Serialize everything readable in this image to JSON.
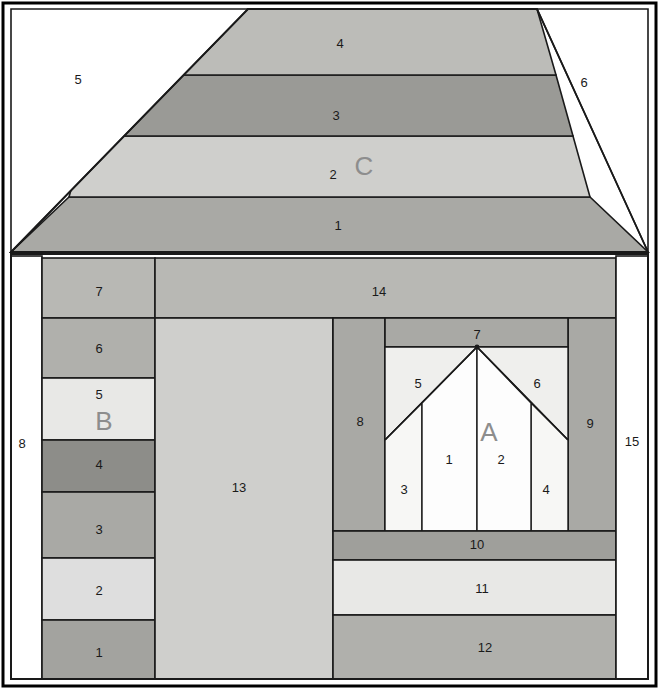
{
  "diagram": {
    "canvas": {
      "width": 659,
      "height": 689,
      "background": "#ffffff"
    },
    "border": {
      "color": "#000000",
      "width": 2
    },
    "palette": {
      "white": "#ffffff",
      "very_light": "#f2f2f0",
      "light": "#e3e3e1",
      "light_mid": "#cfcfcc",
      "mid": "#b8b8b4",
      "mid_dark": "#a9a9a5",
      "dark": "#9a9a96",
      "darker": "#8d8d89",
      "outline": "#1a1a1a",
      "label_text": "#1a1a1a",
      "section_letter": "#8d8d8d"
    },
    "sections": [
      {
        "letter": "C",
        "name": "roof-unit"
      },
      {
        "letter": "B",
        "name": "left-column-unit"
      },
      {
        "letter": "A",
        "name": "window-unit"
      }
    ]
  },
  "roof": {
    "unit_letter": "C",
    "letter_pos": {
      "x": 364,
      "y": 166
    },
    "left_triangle_label": "5",
    "left_triangle_pos": {
      "x": 78,
      "y": 79
    },
    "right_triangle_label": "6",
    "right_triangle_pos": {
      "x": 584,
      "y": 82
    },
    "bands": [
      {
        "label": "1",
        "pos": {
          "x": 338,
          "y": 225
        },
        "fill": "#a9a9a5"
      },
      {
        "label": "2",
        "pos": {
          "x": 333,
          "y": 174
        },
        "fill": "#cfcfcc"
      },
      {
        "label": "3",
        "pos": {
          "x": 336,
          "y": 115
        },
        "fill": "#9a9a96"
      },
      {
        "label": "4",
        "pos": {
          "x": 340,
          "y": 43
        },
        "fill": "#bcbcb8"
      }
    ],
    "geometry": {
      "apex_left_x": 246,
      "apex_right_x": 426,
      "top_y": 9,
      "base_left_x": 11,
      "base_right_x": 648,
      "base_y": 252,
      "band_y": [
        9,
        75,
        136,
        197,
        252
      ]
    }
  },
  "left_column": {
    "unit_letter": "B",
    "letter_pos": {
      "x": 104,
      "y": 421
    },
    "outer_strip": {
      "label": "8",
      "pos": {
        "x": 22,
        "y": 443
      },
      "fill": "#ffffff"
    },
    "pieces": [
      {
        "label": "7",
        "pos": {
          "x": 99,
          "y": 291
        },
        "fill": "#b8b8b4",
        "y0": 258,
        "y1": 318
      },
      {
        "label": "6",
        "pos": {
          "x": 99,
          "y": 348
        },
        "fill": "#b0b0ac",
        "y0": 318,
        "y1": 378
      },
      {
        "label": "5",
        "pos": {
          "x": 99,
          "y": 394
        },
        "fill": "#e8e8e6",
        "y0": 378,
        "y1": 440
      },
      {
        "label": "4",
        "pos": {
          "x": 99,
          "y": 464
        },
        "fill": "#8d8d89",
        "y0": 440,
        "y1": 492
      },
      {
        "label": "3",
        "pos": {
          "x": 99,
          "y": 529
        },
        "fill": "#a9a9a5",
        "y0": 492,
        "y1": 558
      },
      {
        "label": "2",
        "pos": {
          "x": 99,
          "y": 590
        },
        "fill": "#dedede",
        "y0": 558,
        "y1": 620
      },
      {
        "label": "1",
        "pos": {
          "x": 99,
          "y": 652
        },
        "fill": "#a3a39f",
        "y0": 620,
        "y1": 679
      }
    ],
    "x0": 42,
    "x1": 155
  },
  "center": {
    "header": {
      "label": "14",
      "pos": {
        "x": 379,
        "y": 291
      },
      "fill": "#b8b8b4"
    },
    "door": {
      "label": "13",
      "pos": {
        "x": 239,
        "y": 487
      },
      "fill": "#cfcfcc"
    }
  },
  "window_unit": {
    "unit_letter": "A",
    "letter_pos": {
      "x": 489,
      "y": 432
    },
    "frame_left": {
      "label": "8",
      "pos": {
        "x": 360,
        "y": 421
      },
      "fill": "#a9a9a5"
    },
    "frame_right": {
      "label": "9",
      "pos": {
        "x": 590,
        "y": 423
      },
      "fill": "#a9a9a5"
    },
    "header_top": {
      "label": "7",
      "pos": {
        "x": 477,
        "y": 334
      },
      "fill": "#a9a9a5"
    },
    "panes": [
      {
        "label": "5",
        "pos": {
          "x": 418,
          "y": 383
        },
        "fill": "#efefed"
      },
      {
        "label": "6",
        "pos": {
          "x": 537,
          "y": 383
        },
        "fill": "#efefed"
      },
      {
        "label": "3",
        "pos": {
          "x": 404,
          "y": 489
        },
        "fill": "#f5f5f3"
      },
      {
        "label": "4",
        "pos": {
          "x": 546,
          "y": 489
        },
        "fill": "#f5f5f3"
      },
      {
        "label": "1",
        "pos": {
          "x": 449,
          "y": 459
        },
        "fill": "#fdfdfd"
      },
      {
        "label": "2",
        "pos": {
          "x": 501,
          "y": 459
        },
        "fill": "#fdfdfd"
      }
    ],
    "sill": {
      "label": "10",
      "pos": {
        "x": 477,
        "y": 544
      },
      "fill": "#9f9f9b"
    },
    "band_11": {
      "label": "11",
      "pos": {
        "x": 482,
        "y": 588
      },
      "fill": "#e8e8e6"
    },
    "band_12": {
      "label": "12",
      "pos": {
        "x": 485,
        "y": 647
      },
      "fill": "#b0b0ac"
    },
    "outer_right_strip": {
      "label": "15",
      "pos": {
        "x": 632,
        "y": 441
      },
      "fill": "#ffffff"
    }
  }
}
